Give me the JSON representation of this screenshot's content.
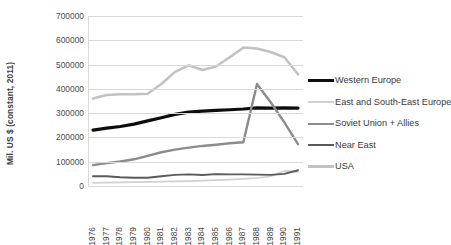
{
  "chart_data": {
    "type": "line",
    "title": "",
    "xlabel": "",
    "ylabel": "Mil. US $ (constant, 2011)",
    "categories": [
      "1976",
      "1977",
      "1978",
      "1979",
      "1980",
      "1981",
      "1982",
      "1983",
      "1984",
      "1985",
      "1986",
      "1987",
      "1988",
      "1989",
      "1990",
      "1991"
    ],
    "yticks": [
      0,
      100000,
      200000,
      300000,
      400000,
      500000,
      600000,
      700000
    ],
    "ytick_labels": [
      "0",
      "100000",
      "200000",
      "300000",
      "400000",
      "500000",
      "600000",
      "700000"
    ],
    "ylim": [
      0,
      700000
    ],
    "grid": true,
    "legend_position": "right",
    "series": [
      {
        "name": "Western Europe",
        "color": "#0d0d0d",
        "width": 3.2,
        "values": [
          230000,
          238000,
          245000,
          255000,
          268000,
          281000,
          295000,
          304000,
          308000,
          311000,
          314000,
          317000,
          322000,
          321000,
          322000,
          321000
        ]
      },
      {
        "name": "East and South-East Europe",
        "color": "#d0d0d0",
        "width": 1.7,
        "values": [
          13000,
          14000,
          15000,
          16000,
          17000,
          18000,
          19000,
          20000,
          22000,
          24000,
          26000,
          29000,
          33000,
          40000,
          62000,
          58000
        ]
      },
      {
        "name": "Soviet Union + Allies",
        "color": "#8c8c8c",
        "width": 2.4,
        "values": [
          86000,
          94000,
          101000,
          110000,
          124000,
          139000,
          150000,
          158000,
          165000,
          170000,
          176000,
          180000,
          420000,
          345000,
          262000,
          172000
        ]
      },
      {
        "name": "Near East",
        "color": "#5a5a5a",
        "width": 1.9,
        "values": [
          40000,
          40000,
          36000,
          34000,
          34000,
          40000,
          46000,
          48000,
          45000,
          49000,
          48000,
          48000,
          47000,
          46000,
          50000,
          65000
        ]
      },
      {
        "name": "USA",
        "color": "#c2c2c2",
        "width": 2.6,
        "values": [
          360000,
          375000,
          378000,
          378000,
          380000,
          420000,
          470000,
          497000,
          478000,
          492000,
          530000,
          570000,
          566000,
          552000,
          530000,
          460000
        ]
      }
    ]
  }
}
